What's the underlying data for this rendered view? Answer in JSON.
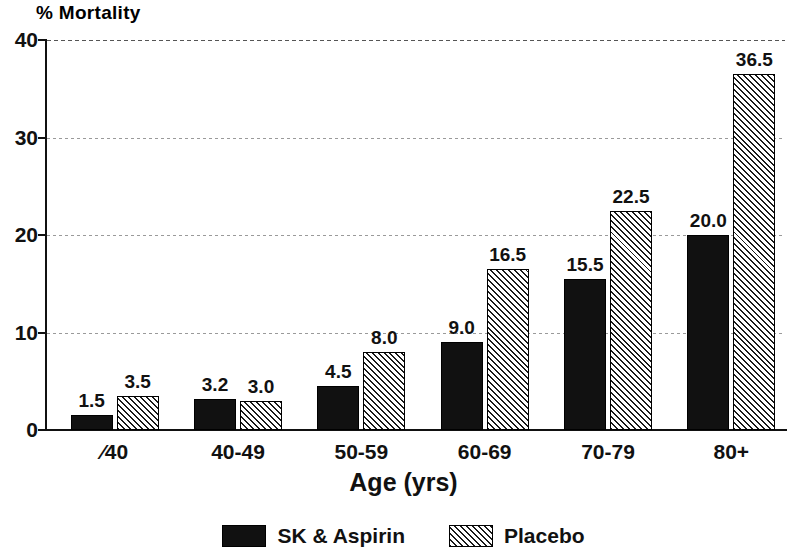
{
  "chart_data": {
    "type": "bar",
    "title": "",
    "xlabel": "Age (yrs)",
    "ylabel": "% Mortality",
    "categories": [
      "⁄40",
      "40-49",
      "50-59",
      "60-69",
      "70-79",
      "80+"
    ],
    "series": [
      {
        "name": "SK & Aspirin",
        "color": "#111111",
        "fill": "solid",
        "values": [
          1.5,
          3.2,
          4.5,
          9.0,
          15.5,
          20.0
        ],
        "value_labels": [
          "1.5",
          "3.2",
          "4.5",
          "9.0",
          "15.5",
          "20.0"
        ]
      },
      {
        "name": "Placebo",
        "color": "#111111",
        "fill": "diagonal-hatch",
        "values": [
          3.5,
          3.0,
          8.0,
          16.5,
          22.5,
          36.5
        ],
        "value_labels": [
          "3.5",
          "3.0",
          "8.0",
          "16.5",
          "22.5",
          "36.5"
        ]
      }
    ],
    "ylim": [
      0,
      40
    ],
    "yticks": [
      0,
      10,
      20,
      30,
      40
    ],
    "ytick_labels": [
      "0",
      "10",
      "20",
      "30",
      "40"
    ],
    "grid": "horizontal-dashed",
    "legend_position": "bottom-center"
  },
  "legend": {
    "items": [
      {
        "label": "SK & Aspirin",
        "swatch": "solid-black"
      },
      {
        "label": "Placebo",
        "swatch": "hatched"
      }
    ]
  }
}
